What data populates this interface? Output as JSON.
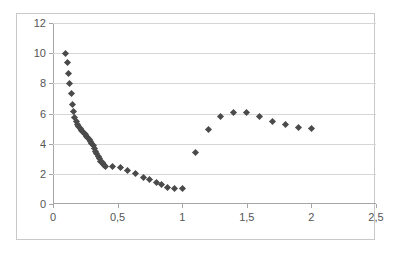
{
  "chart_data": {
    "type": "scatter",
    "title": "",
    "xlabel": "",
    "ylabel": "",
    "xlim": [
      0,
      2.5
    ],
    "ylim": [
      0,
      12
    ],
    "grid": true,
    "legend": "none",
    "decimal_separator": ",",
    "marker": "diamond",
    "marker_color": "#4a4a4a",
    "x_ticks": [
      0,
      0.5,
      1,
      1.5,
      2,
      2.5
    ],
    "x_tick_labels": [
      "0",
      "0,5",
      "1",
      "1,5",
      "2",
      "2,5"
    ],
    "y_ticks": [
      0,
      2,
      4,
      6,
      8,
      10,
      12
    ],
    "y_tick_labels": [
      "0",
      "2",
      "4",
      "6",
      "8",
      "10",
      "12"
    ],
    "series": [
      {
        "name": "series-1",
        "points": [
          [
            0.1,
            10.0
          ],
          [
            0.11,
            9.35
          ],
          [
            0.12,
            8.65
          ],
          [
            0.13,
            8.0
          ],
          [
            0.14,
            7.3
          ],
          [
            0.15,
            6.6
          ],
          [
            0.16,
            6.1
          ],
          [
            0.17,
            5.75
          ],
          [
            0.18,
            5.5
          ],
          [
            0.19,
            5.3
          ],
          [
            0.2,
            5.15
          ],
          [
            0.21,
            5.0
          ],
          [
            0.22,
            4.9
          ],
          [
            0.23,
            4.8
          ],
          [
            0.24,
            4.7
          ],
          [
            0.25,
            4.6
          ],
          [
            0.26,
            4.5
          ],
          [
            0.27,
            4.4
          ],
          [
            0.28,
            4.28
          ],
          [
            0.29,
            4.15
          ],
          [
            0.3,
            4.0
          ],
          [
            0.31,
            3.85
          ],
          [
            0.32,
            3.68
          ],
          [
            0.33,
            3.5
          ],
          [
            0.34,
            3.32
          ],
          [
            0.35,
            3.15
          ],
          [
            0.36,
            3.0
          ],
          [
            0.37,
            2.85
          ],
          [
            0.38,
            2.72
          ],
          [
            0.39,
            2.62
          ],
          [
            0.4,
            2.55
          ],
          [
            0.41,
            2.5
          ],
          [
            0.46,
            2.5
          ],
          [
            0.52,
            2.4
          ],
          [
            0.58,
            2.22
          ],
          [
            0.64,
            2.0
          ],
          [
            0.7,
            1.78
          ],
          [
            0.75,
            1.6
          ],
          [
            0.8,
            1.45
          ],
          [
            0.84,
            1.3
          ],
          [
            0.89,
            1.12
          ],
          [
            0.94,
            1.05
          ],
          [
            1.0,
            1.0
          ],
          [
            1.1,
            3.42
          ],
          [
            1.2,
            4.95
          ],
          [
            1.3,
            5.78
          ],
          [
            1.4,
            6.08
          ],
          [
            1.5,
            6.05
          ],
          [
            1.6,
            5.82
          ],
          [
            1.7,
            5.5
          ],
          [
            1.8,
            5.25
          ],
          [
            1.9,
            5.05
          ],
          [
            2.0,
            5.0
          ]
        ]
      }
    ]
  }
}
